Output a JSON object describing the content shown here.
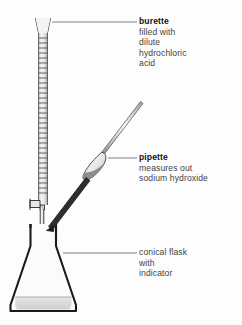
{
  "figure": {
    "kind": "titration-apparatus-diagram",
    "background_color": "#fdfdfd",
    "line_color": "#1a1a1a",
    "text_color": "#3c3c3c",
    "title_color": "#111111",
    "glass_fill": "#f2f2f2",
    "liquid_fill": "#d8d8d8",
    "pipette_dark_fill": "#3a3a3a"
  },
  "labels": {
    "burette": {
      "title": "burette",
      "bold": true,
      "lines": [
        "filled with",
        "dilute",
        "hydrochloric",
        "acid"
      ],
      "leader": {
        "x1": 52,
        "y1": 22,
        "x2": 137,
        "y2": 22
      }
    },
    "pipette": {
      "title": "pipette",
      "bold": true,
      "lines": [
        "measures out",
        "sodium hydroxide"
      ],
      "leader": {
        "x1": 108,
        "y1": 158,
        "x2": 137,
        "y2": 158
      }
    },
    "flask": {
      "title": "conical flask",
      "bold": false,
      "lines": [
        "with",
        "indicator"
      ],
      "leader": {
        "x1": 63,
        "y1": 253,
        "x2": 137,
        "y2": 253
      }
    }
  },
  "parts": {
    "burette": {
      "name": "burette",
      "graduation_count": 34,
      "top_y": 18,
      "tap_y": 205
    },
    "pipette": {
      "name": "pipette",
      "tip": [
        47,
        228
      ],
      "top": [
        142,
        103
      ],
      "bulb_center": [
        95,
        160
      ]
    },
    "conical_flask": {
      "name": "conical flask",
      "neck_top_y": 224,
      "base_y": 311,
      "liquid_top_y": 297
    }
  }
}
